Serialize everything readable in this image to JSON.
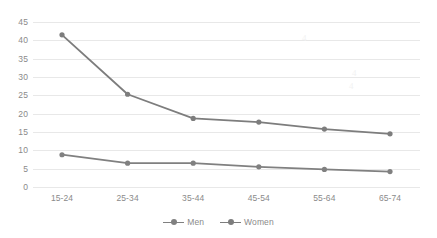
{
  "chart_data": {
    "type": "line",
    "title": "",
    "subtitle": "",
    "xlabel": "",
    "ylabel": "",
    "categories": [
      "15-24",
      "25-34",
      "35-44",
      "45-54",
      "55-64",
      "65-74"
    ],
    "series": [
      {
        "name": "Men",
        "values": [
          8.8,
          6.5,
          6.5,
          5.5,
          4.8,
          4.2
        ],
        "color": "#808080"
      },
      {
        "name": "Women",
        "values": [
          41.5,
          25.3,
          18.7,
          17.7,
          15.8,
          14.5
        ],
        "color": "#7d7d7d"
      }
    ],
    "ylim": [
      0,
      45
    ],
    "ytick_step": 5,
    "yticks": [
      "0",
      "5",
      "10",
      "15",
      "20",
      "25",
      "30",
      "35",
      "40",
      "45"
    ],
    "grid": true,
    "grid_axis": "y",
    "legend_position": "bottom-center",
    "marker": "circle",
    "gridline_color": "#e8e8e8",
    "axis_text_color": "#8a8a8a"
  },
  "legend": {
    "entries": [
      {
        "label": "Men"
      },
      {
        "label": "Women"
      }
    ]
  },
  "artifacts": {
    "mark_1": "4",
    "mark_2": "4",
    "mark_3": "4"
  }
}
